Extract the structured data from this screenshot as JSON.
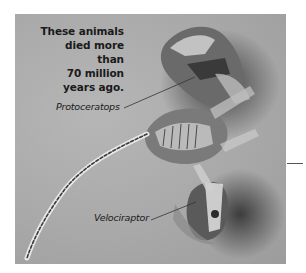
{
  "figure": {
    "caption": "These animals died more than 70 million years ago.",
    "caption_lines": [
      "These animals",
      "died more than",
      "70 million",
      "years ago."
    ],
    "labels": {
      "protoceratops": "Protoceratops",
      "velociraptor": "Velociraptor"
    }
  }
}
